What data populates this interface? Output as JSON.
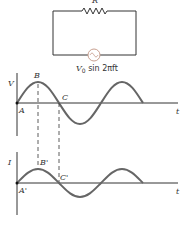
{
  "circuit": {
    "resistor_label": "R",
    "source_label_main": "V",
    "source_label_sub": "0",
    "source_label_rest": " sin 2πft",
    "wire_color": "#333333",
    "source_color": "#c8a090"
  },
  "voltage_graph": {
    "y_label": "V",
    "x_label": "t",
    "points": {
      "origin": "A",
      "peak": "B",
      "zero_cross": "C"
    },
    "curve_color": "#666666",
    "amplitude_px": 21,
    "period_px": 84
  },
  "current_graph": {
    "y_label": "I",
    "x_label": "t",
    "points": {
      "origin": "A'",
      "peak": "B'",
      "zero_cross": "C'"
    },
    "curve_color": "#666666",
    "amplitude_px": 14,
    "period_px": 84
  }
}
